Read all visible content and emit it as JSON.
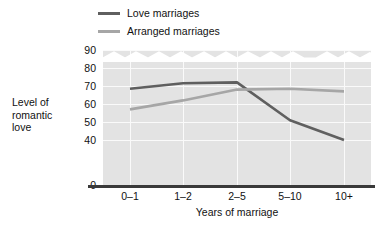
{
  "chart_data": {
    "type": "line",
    "title": "",
    "xlabel": "Years of marriage",
    "ylabel": "Level of romantic love",
    "categories": [
      "0–1",
      "1–2",
      "2–5",
      "5–10",
      "10+"
    ],
    "yticks": [
      90,
      80,
      70,
      60,
      50,
      40,
      0
    ],
    "ylim": [
      0,
      90
    ],
    "y_axis_break": true,
    "y_axis_break_between": [
      0,
      40
    ],
    "grid": true,
    "legend_position": "top-left",
    "series": [
      {
        "name": "Love marriages",
        "color": "#5f5f5f",
        "values": [
          68.5,
          71.5,
          72,
          51,
          40
        ]
      },
      {
        "name": "Arranged marriages",
        "color": "#a6a6a6",
        "values": [
          57,
          62,
          68,
          68.5,
          67
        ]
      }
    ]
  },
  "legend": {
    "items": [
      {
        "label": "Love marriages",
        "color": "#5f5f5f"
      },
      {
        "label": "Arranged marriages",
        "color": "#a6a6a6"
      }
    ]
  },
  "axes": {
    "y_title_line1": "Level of",
    "y_title_line2": "romantic",
    "y_title_line3": "love",
    "x_title": "Years of marriage",
    "y_labels": [
      "90",
      "80",
      "70",
      "60",
      "50",
      "40",
      "0"
    ],
    "x_labels": [
      "0–1",
      "1–2",
      "2–5",
      "5–10",
      "10+"
    ]
  },
  "colors": {
    "plot_background": "#e3e3e3",
    "gridline": "#fafafa",
    "baseline": "#3a3a3a",
    "text": "#111111"
  }
}
